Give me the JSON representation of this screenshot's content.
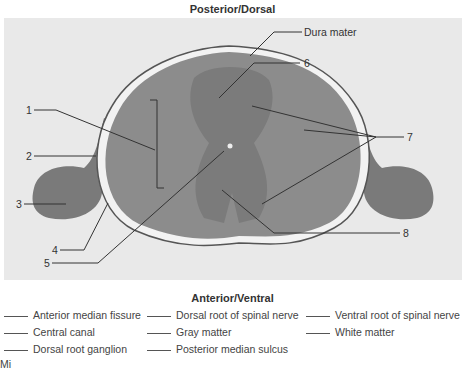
{
  "diagram": {
    "orientation_top": "Posterior/Dorsal",
    "orientation_bottom": "Anterior/Ventral",
    "callouts": [
      {
        "id": "dura",
        "label": "Dura mater"
      },
      {
        "id": "1",
        "label": "1"
      },
      {
        "id": "2",
        "label": "2"
      },
      {
        "id": "3",
        "label": "3"
      },
      {
        "id": "4",
        "label": "4"
      },
      {
        "id": "5",
        "label": "5"
      },
      {
        "id": "6",
        "label": "6"
      },
      {
        "id": "7",
        "label": "7"
      },
      {
        "id": "8",
        "label": "8"
      }
    ],
    "answer_options": [
      {
        "label": "Anterior median fissure"
      },
      {
        "label": "Dorsal root of spinal nerve"
      },
      {
        "label": "Ventral root of spinal nerve"
      },
      {
        "label": "Central canal"
      },
      {
        "label": "Gray matter"
      },
      {
        "label": "White matter"
      },
      {
        "label": "Dorsal root ganglion"
      },
      {
        "label": "Posterior median sulcus"
      }
    ],
    "caption_partial": "Mi",
    "colors": {
      "background": "#e9e9e9",
      "tissue": "#8a8a8a",
      "tissue_dark": "#6e6e6e",
      "leader_line": "#333333"
    }
  }
}
